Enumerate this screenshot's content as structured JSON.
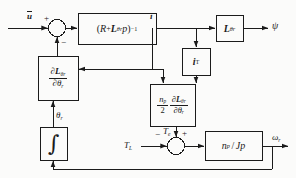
{
  "figure": {
    "type": "control-block-diagram",
    "title": "",
    "background_color": "#fbfbfa",
    "line_color": "#1b1b1b"
  },
  "signals": {
    "input_u": "u",
    "current_i": "i",
    "flux_psi": "ψ",
    "angle_theta_r": "θ",
    "angle_theta_r_sub": "r",
    "torque_load": "T",
    "torque_load_sub": "L",
    "torque_electromagnetic": "T",
    "torque_electromagnetic_sub": "e",
    "speed_omega_r": "ω",
    "speed_omega_r_sub": "r"
  },
  "signs": {
    "sum1_plus": "+",
    "sum1_minus": "−",
    "sum2_minus": "−",
    "sum2_plus": "+"
  },
  "blocks": [
    {
      "id": "impedance-inverse",
      "name": "impedance-inverse-block",
      "label_plain": "(R + Lθr p)⁻¹",
      "parts": {
        "open": "(",
        "R": "R",
        "plus": "+",
        "L": "L",
        "L_sub": "θr",
        "p": "p",
        "close": ")",
        "exp": "−1"
      }
    },
    {
      "id": "inductance",
      "name": "inductance-block",
      "label_plain": "Lθr",
      "parts": {
        "L": "L",
        "L_sub": "θr"
      }
    },
    {
      "id": "current-transpose",
      "name": "current-transpose-block",
      "label_plain": "iᵀ",
      "parts": {
        "i": "i",
        "sup": "T"
      }
    },
    {
      "id": "dl-dtheta-left",
      "name": "partial-inductance-derivative-block",
      "label_plain": "∂Lθr / ∂θr",
      "parts": {
        "num_d": "∂",
        "num_L": "L",
        "num_sub": "θr",
        "den_d": "∂",
        "den_theta": "θ",
        "den_sub": "r"
      }
    },
    {
      "id": "torque-gain",
      "name": "torque-production-block",
      "label_plain": "(np/2) ∂Lθr / ∂θr",
      "parts": {
        "num_n": "n",
        "num_n_sub": "p",
        "den_two": "2",
        "d_num_d": "∂",
        "d_num_L": "L",
        "d_num_sub": "θr",
        "d_den_d": "∂",
        "d_den_theta": "θ",
        "d_den_sub": "r"
      }
    },
    {
      "id": "mechanical",
      "name": "mechanical-dynamics-block",
      "label_plain": "np / Jp",
      "parts": {
        "n": "n",
        "n_sub": "p",
        "slash": "/",
        "J": "J",
        "p": "p"
      }
    },
    {
      "id": "integrator",
      "name": "integrator-block",
      "label_plain": "∫",
      "parts": {
        "sym": "∫"
      }
    }
  ],
  "summing_junctions": [
    {
      "id": "sum-input",
      "name": "summing-junction-input"
    },
    {
      "id": "sum-torque",
      "name": "summing-junction-torque"
    }
  ]
}
